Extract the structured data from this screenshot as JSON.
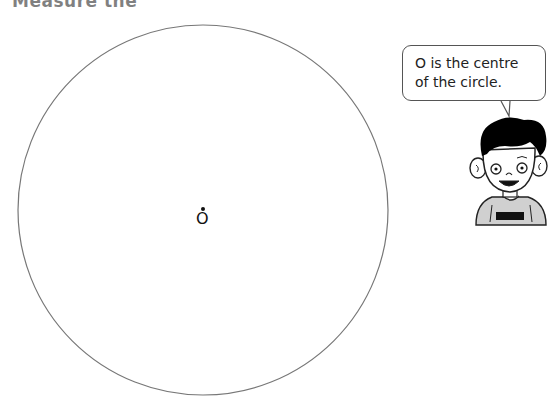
{
  "page": {
    "heading_partial": "Measure the"
  },
  "figure": {
    "circle": {
      "center_x": 203,
      "center_y": 210,
      "radius": 185,
      "stroke": "#777777"
    },
    "center_point": {
      "label": "O",
      "dot_color": "#111111"
    }
  },
  "speech_bubble": {
    "text": "O is the centre\nof the circle."
  },
  "character": {
    "description": "cartoon boy with black hair",
    "hair_color": "#000000",
    "shirt_color": "#d0d0d0"
  }
}
